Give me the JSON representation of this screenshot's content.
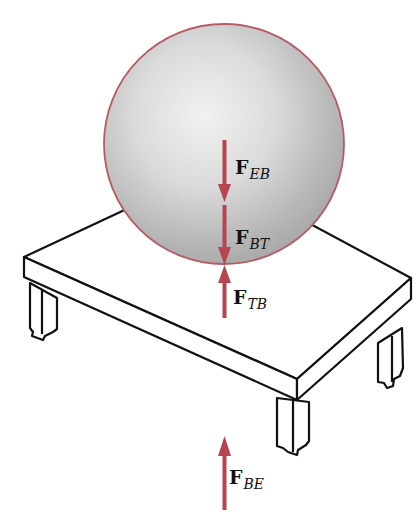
{
  "diagram": {
    "colors": {
      "arrow": "#b5454f",
      "sphere_outline": "#b85a62",
      "table_line": "#111111",
      "sphere_highlight": "#f4f4f4",
      "sphere_shadow": "#9c9c9c"
    },
    "objects": {
      "sphere": {
        "label": "ball"
      },
      "table": {
        "label": "table"
      }
    },
    "forces": [
      {
        "id": "F_EB",
        "symbol": "F",
        "subscript": "EB",
        "direction": "down"
      },
      {
        "id": "F_BT",
        "symbol": "F",
        "subscript": "BT",
        "direction": "down"
      },
      {
        "id": "F_TB",
        "symbol": "F",
        "subscript": "TB",
        "direction": "up"
      },
      {
        "id": "F_BE",
        "symbol": "F",
        "subscript": "BE",
        "direction": "up"
      }
    ]
  }
}
